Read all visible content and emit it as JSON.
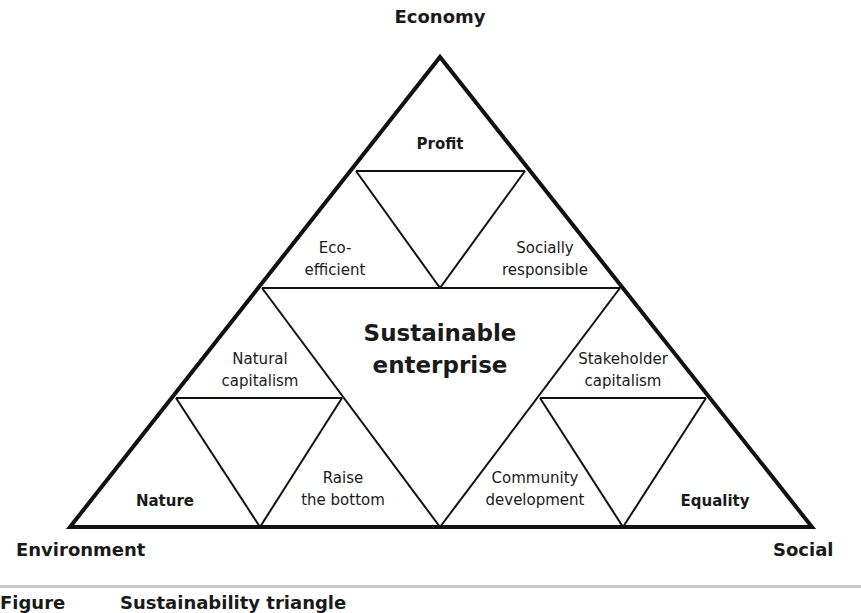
{
  "vertices": {
    "top": "Economy",
    "bottom_left": "Environment",
    "bottom_right": "Social"
  },
  "center": {
    "line1": "Sustainable",
    "line2": "enterprise"
  },
  "cells": {
    "profit": {
      "line1": "Profit"
    },
    "eco_efficient": {
      "line1": "Eco-",
      "line2": "efficient"
    },
    "socially_responsible": {
      "line1": "Socially",
      "line2": "responsible"
    },
    "natural_capitalism": {
      "line1": "Natural",
      "line2": "capitalism"
    },
    "stakeholder_capitalism": {
      "line1": "Stakeholder",
      "line2": "capitalism"
    },
    "nature": {
      "line1": "Nature"
    },
    "raise_the_bottom": {
      "line1": "Raise",
      "line2": "the bottom"
    },
    "community_development": {
      "line1": "Community",
      "line2": "development"
    },
    "equality": {
      "line1": "Equality"
    }
  },
  "caption": {
    "label": "Figure",
    "title": "Sustainability triangle"
  },
  "colors": {
    "line": "#111111",
    "rule": "#c8c8c8",
    "text": "#1a1a1a"
  }
}
